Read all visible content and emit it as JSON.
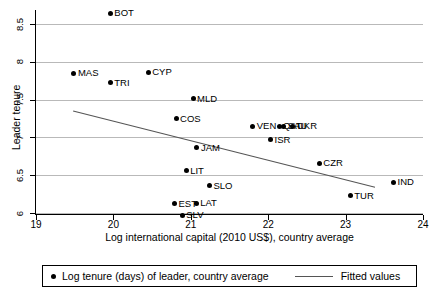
{
  "chart_data": {
    "type": "scatter",
    "title": "",
    "xlabel": "Log international capital (2010 US$), country average",
    "ylabel": "Leader tenure",
    "xlim": [
      19,
      24
    ],
    "ylim": [
      5.8,
      8.75
    ],
    "grid": true,
    "xticks": [
      19,
      20,
      21,
      22,
      23,
      24
    ],
    "yticks": [
      6,
      6.5,
      7,
      7.5,
      8,
      8.5
    ],
    "xtick_labels": [
      "19",
      "20",
      "21",
      "22",
      "23",
      "24"
    ],
    "ytick_labels": [
      "6",
      "6.5",
      "7",
      "7.5",
      "8",
      "8.5"
    ],
    "legend_position": "below-axis",
    "points": [
      {
        "label": "BOT",
        "x": 19.96,
        "y": 8.64
      },
      {
        "label": "MAS",
        "x": 19.49,
        "y": 7.85
      },
      {
        "label": "CYP",
        "x": 20.45,
        "y": 7.86
      },
      {
        "label": "TRI",
        "x": 19.96,
        "y": 7.72
      },
      {
        "label": "MLD",
        "x": 21.03,
        "y": 7.51
      },
      {
        "label": "COS",
        "x": 20.81,
        "y": 7.25
      },
      {
        "label": "VEN",
        "x": 21.8,
        "y": 7.15
      },
      {
        "label": "QAT",
        "x": 22.14,
        "y": 7.15
      },
      {
        "label": "SAU",
        "x": 22.2,
        "y": 7.15
      },
      {
        "label": "UKR",
        "x": 22.32,
        "y": 7.15
      },
      {
        "label": "ISR",
        "x": 22.03,
        "y": 6.97
      },
      {
        "label": "JAM",
        "x": 21.08,
        "y": 6.86
      },
      {
        "label": "CZR",
        "x": 22.66,
        "y": 6.66
      },
      {
        "label": "LIT",
        "x": 20.94,
        "y": 6.56
      },
      {
        "label": "SLO",
        "x": 21.24,
        "y": 6.36
      },
      {
        "label": "IND",
        "x": 23.62,
        "y": 6.41
      },
      {
        "label": "TUR",
        "x": 23.06,
        "y": 6.23
      },
      {
        "label": "EST",
        "x": 20.79,
        "y": 6.12
      },
      {
        "label": "LAT",
        "x": 21.07,
        "y": 6.13
      },
      {
        "label": "SLV",
        "x": 20.89,
        "y": 5.97
      }
    ],
    "fit_line": {
      "x0": 19.48,
      "y0": 7.35,
      "x1": 23.38,
      "y1": 6.34
    },
    "series_names": [
      "Log tenure (days) of leader, country average",
      "Fitted values"
    ]
  },
  "legend": {
    "scatter_label": "Log tenure (days) of leader, country average",
    "line_label": "Fitted values"
  },
  "colors": {
    "marker": "#000000",
    "grid": "#b9b9b9",
    "fit_line": "#555555",
    "axis": "#000000",
    "background": "#ffffff"
  }
}
